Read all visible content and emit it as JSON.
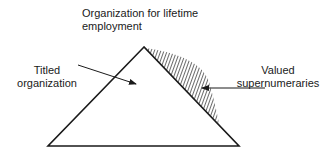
{
  "diagram": {
    "title_line1": "Organization for lifetime",
    "title_line2": "employment",
    "labels": {
      "titled_line1": "Titled",
      "titled_line2": "organization",
      "valued_line1": "Valued",
      "valued_line2": "supernumeraries"
    },
    "colors": {
      "stroke": "#1a1a1a",
      "background": "#ffffff"
    }
  }
}
